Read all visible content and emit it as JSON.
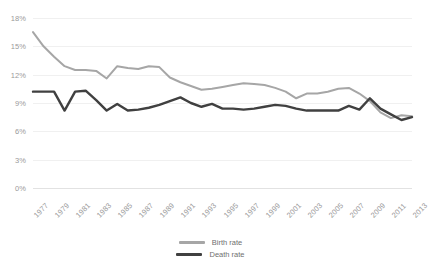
{
  "chart_data": {
    "type": "line",
    "title": "",
    "xlabel": "",
    "ylabel": "",
    "grid": true,
    "legend_position": "bottom",
    "ylim": [
      0,
      18
    ],
    "ytick_labels": [
      "18%",
      "15%",
      "12%",
      "9%",
      "6%",
      "3%",
      "0%"
    ],
    "ytick_values": [
      18,
      15,
      12,
      9,
      6,
      3,
      0
    ],
    "x": [
      1977,
      1978,
      1979,
      1980,
      1981,
      1982,
      1983,
      1984,
      1985,
      1986,
      1987,
      1988,
      1989,
      1990,
      1991,
      1992,
      1993,
      1994,
      1995,
      1996,
      1997,
      1998,
      1999,
      2000,
      2001,
      2002,
      2003,
      2004,
      2005,
      2006,
      2007,
      2008,
      2009,
      2010,
      2011,
      2012,
      2013
    ],
    "xtick_labels": [
      "1977",
      "1979",
      "1981",
      "1983",
      "1985",
      "1987",
      "1989",
      "1991",
      "1993",
      "1995",
      "1997",
      "1999",
      "2001",
      "2003",
      "2005",
      "2007",
      "2009",
      "2011",
      "2013"
    ],
    "xtick_values": [
      1977,
      1979,
      1981,
      1983,
      1985,
      1987,
      1989,
      1991,
      1993,
      1995,
      1997,
      1999,
      2001,
      2003,
      2005,
      2007,
      2009,
      2011,
      2013
    ],
    "series": [
      {
        "name": "Birth rate",
        "color": "#a6a6a6",
        "values": [
          16.5,
          15.0,
          13.9,
          12.9,
          12.5,
          12.5,
          12.4,
          11.6,
          12.9,
          12.7,
          12.6,
          12.9,
          12.8,
          11.7,
          11.2,
          10.8,
          10.4,
          10.5,
          10.7,
          10.9,
          11.1,
          11.0,
          10.9,
          10.6,
          10.2,
          9.5,
          10.0,
          10.0,
          10.2,
          10.5,
          10.6,
          10.0,
          9.2,
          8.0,
          7.4,
          7.7,
          7.6
        ],
        "marker": "none",
        "linewidth": 2
      },
      {
        "name": "Death rate",
        "color": "#404040",
        "values": [
          10.2,
          10.2,
          10.2,
          8.2,
          10.2,
          10.3,
          9.3,
          8.2,
          8.9,
          8.2,
          8.3,
          8.5,
          8.8,
          9.2,
          9.6,
          9.0,
          8.6,
          8.9,
          8.4,
          8.4,
          8.3,
          8.4,
          8.6,
          8.8,
          8.7,
          8.4,
          8.2,
          8.2,
          8.2,
          8.2,
          8.7,
          8.3,
          9.5,
          8.4,
          7.8,
          7.2,
          7.5
        ],
        "marker": "none",
        "linewidth": 2.4
      }
    ]
  },
  "legend": {
    "items": [
      {
        "label": "Birth rate"
      },
      {
        "label": "Death rate"
      }
    ]
  },
  "colors": {
    "birth_rate": "#a6a6a6",
    "death_rate": "#404040",
    "gridline": "#f0f0f0",
    "axis": "#e2e2e2",
    "tick_text": "#9a9a9a"
  }
}
